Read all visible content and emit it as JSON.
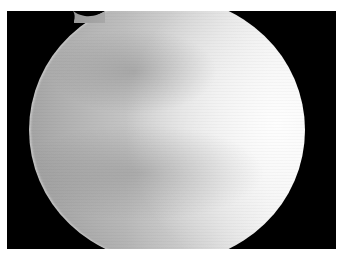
{
  "image": {
    "description": "Grayscale photograph of a bright spherical/disk-shaped object on black background, framed by a white border",
    "colors": {
      "border": "#ffffff",
      "background": "#000000",
      "disk_dark": "#a4a4a4",
      "disk_bright": "#f4f4f4"
    }
  }
}
